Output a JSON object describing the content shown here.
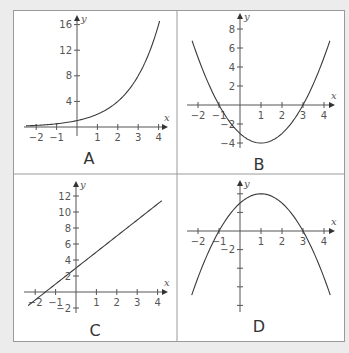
{
  "figure": {
    "panels": [
      "A",
      "B",
      "C",
      "D"
    ],
    "axis_labels": {
      "x": "x",
      "y": "y"
    },
    "colors": {
      "background": "#ececec",
      "panel": "#ffffff",
      "border": "#9a9a9a",
      "curve": "#3a3a3a",
      "axis": "#555555"
    }
  },
  "chart_data": [
    {
      "panel": "A",
      "type": "line",
      "title": "A",
      "xlabel": "x",
      "ylabel": "y",
      "x_ticks": [
        -2,
        -1,
        1,
        2,
        3,
        4
      ],
      "y_ticks": [
        4,
        8,
        12,
        16
      ],
      "xlim": [
        -2.5,
        4.2
      ],
      "ylim": [
        0,
        16.5
      ],
      "function": "y = 2^x",
      "x": [
        -2.5,
        -2,
        -1,
        0,
        1,
        2,
        3,
        4
      ],
      "y": [
        0.18,
        0.25,
        0.5,
        1,
        2,
        4,
        8,
        16
      ],
      "grid": false
    },
    {
      "panel": "B",
      "type": "line",
      "title": "B",
      "xlabel": "x",
      "ylabel": "y",
      "x_ticks": [
        -2,
        -1,
        1,
        2,
        3,
        4
      ],
      "y_ticks": [
        -4,
        -2,
        2,
        4,
        6,
        8
      ],
      "xlim": [
        -2.5,
        4.5
      ],
      "ylim": [
        -4.5,
        9
      ],
      "function": "y = x^2 - 2x - 3",
      "x": [
        -2.2,
        -1,
        0,
        1,
        2,
        3,
        4.2
      ],
      "y": [
        6.24,
        0,
        -3,
        -4,
        -3,
        0,
        6.24
      ],
      "grid": false
    },
    {
      "panel": "C",
      "type": "line",
      "title": "C",
      "xlabel": "x",
      "ylabel": "y",
      "x_ticks": [
        -2,
        -1,
        1,
        2,
        3,
        4
      ],
      "y_ticks": [
        -2,
        2,
        4,
        6,
        8,
        10,
        12
      ],
      "xlim": [
        -2.5,
        4.3
      ],
      "ylim": [
        -2.5,
        13
      ],
      "function": "y = 2x + 3",
      "x": [
        -2.3,
        4.2
      ],
      "y": [
        -1.6,
        11.4
      ],
      "grid": false
    },
    {
      "panel": "D",
      "type": "line",
      "title": "D",
      "xlabel": "x",
      "ylabel": "y",
      "x_ticks": [
        -2,
        -1,
        1,
        2,
        3,
        4
      ],
      "y_ticks": [
        -8,
        -6,
        -4,
        -2,
        2,
        4
      ],
      "y_tick_labels_shown": [
        -2
      ],
      "xlim": [
        -2.5,
        4.5
      ],
      "ylim": [
        -9,
        4.5
      ],
      "function": "y = -x^2 + 2x + 3",
      "x": [
        -2.3,
        -1,
        0,
        1,
        2,
        3,
        4.3
      ],
      "y": [
        -7.89,
        0,
        3,
        4,
        3,
        0,
        -7.89
      ],
      "grid": false
    }
  ]
}
